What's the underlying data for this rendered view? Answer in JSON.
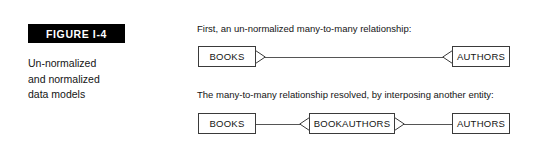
{
  "figure": {
    "badge_label": "FIGURE I-4",
    "caption_lines": [
      "Un-normalized",
      "and normalized",
      "data models"
    ]
  },
  "diagrams": {
    "unnormalized": {
      "note": "First, an un-normalized many-to-many relationship:",
      "entities": [
        {
          "label": "BOOKS"
        },
        {
          "label": "AUTHORS"
        }
      ],
      "relationship": "many-to-many"
    },
    "normalized": {
      "note": "The many-to-many relationship resolved, by interposing another entity:",
      "entities": [
        {
          "label": "BOOKS"
        },
        {
          "label": "BOOKAUTHORS"
        },
        {
          "label": "AUTHORS"
        }
      ],
      "relationship": "one-to-many via associative entity"
    }
  },
  "colors": {
    "badge_background": "#000000",
    "badge_text": "#ffffff",
    "page_background": "#ffffff",
    "line": "#555555",
    "box_border": "#3a3a3a",
    "text": "#141414"
  }
}
